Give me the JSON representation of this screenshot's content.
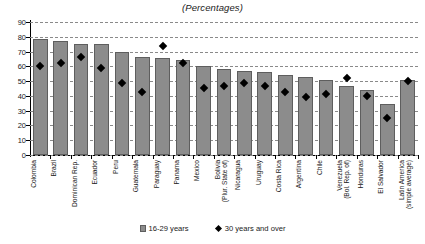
{
  "chart": {
    "title": "(Percentages)",
    "legend": {
      "position": "bottom",
      "bar_label": "16-29 years",
      "marker_label": "30 years and over",
      "bar_icon": "bar-swatch-icon",
      "marker_icon": "diamond-swatch-icon"
    }
  },
  "chart_data": {
    "type": "bar",
    "title": "(Percentages)",
    "xlabel": "",
    "ylabel": "",
    "ylim": [
      0,
      90
    ],
    "yticks": [
      0,
      10,
      20,
      30,
      40,
      50,
      60,
      70,
      80,
      90
    ],
    "grid": true,
    "legend_position": "bottom",
    "categories": [
      "Colombia",
      "Brazil",
      "Dominican Rep.",
      "Ecuador",
      "Peru",
      "Guatemala",
      "Paraguay",
      "Panama",
      "Mexico",
      "Bolivia (Plur. State of)",
      "Nicaragua",
      "Uruguay",
      "Costa Rica",
      "Argentina",
      "Chile",
      "Venezuela (Bol. Rep. of)",
      "Honduras",
      "El Salvador",
      "Latin America (simple average)"
    ],
    "category_lines": [
      [
        "Colombia",
        ""
      ],
      [
        "Brazil",
        ""
      ],
      [
        "Dominican Rep.",
        ""
      ],
      [
        "Ecuador",
        ""
      ],
      [
        "Peru",
        ""
      ],
      [
        "Guatemala",
        ""
      ],
      [
        "Paraguay",
        ""
      ],
      [
        "Panama",
        ""
      ],
      [
        "Mexico",
        ""
      ],
      [
        "Bolivia",
        "(Plur. State of)"
      ],
      [
        "Nicaragua",
        ""
      ],
      [
        "Uruguay",
        ""
      ],
      [
        "Costa Rica",
        ""
      ],
      [
        "Argentina",
        ""
      ],
      [
        "Chile",
        ""
      ],
      [
        "Venezuela",
        "(Bol. Rep. of)"
      ],
      [
        "Honduras",
        ""
      ],
      [
        "El Salvador",
        ""
      ],
      [
        "Latin America",
        "(simple average)"
      ]
    ],
    "series": [
      {
        "name": "16-29 years",
        "kind": "bar",
        "color": "#8c8c8c",
        "values": [
          78.5,
          77,
          75,
          75,
          69.5,
          66,
          65.5,
          64.5,
          60,
          58.5,
          57,
          56,
          54,
          52.5,
          50.5,
          47,
          44,
          34.5,
          50.5
        ]
      },
      {
        "name": "30 years and over",
        "kind": "marker",
        "color": "#000000",
        "values": [
          60,
          62.5,
          66.5,
          59,
          48.5,
          42.5,
          74,
          62,
          45.5,
          47,
          48.5,
          47,
          42.5,
          39,
          41.5,
          52,
          40,
          25,
          50
        ]
      }
    ]
  }
}
